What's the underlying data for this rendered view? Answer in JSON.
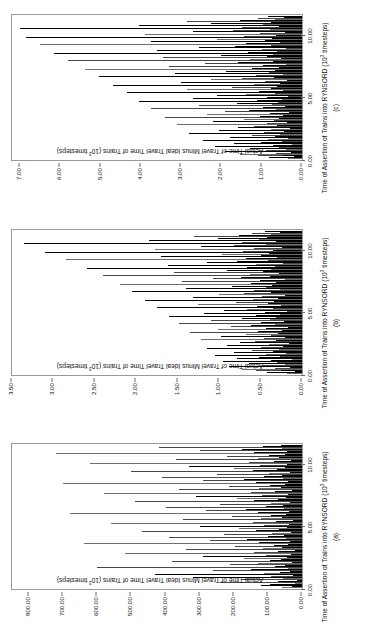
{
  "figure": {
    "orientation": "rotated-90-ccw",
    "background": "#ffffff",
    "frame_color": "#9a9a9a",
    "bar_color": "#000000"
  },
  "panels": [
    {
      "id": "a",
      "letter": "(a)",
      "x_title_main": "Time of Assertion of Trains into RYNSORD (10",
      "x_title_exp": "3",
      "x_title_tail": " timesteps)",
      "y_title_main": "Actual Time of Travel Minus Ideal Travel Time of Trains (10",
      "y_title_exp": "3",
      "y_title_tail": " timesteps)",
      "x_ticks": [
        "0.00",
        "5.00",
        "10.00"
      ],
      "x_tick_values": [
        0,
        5,
        10
      ],
      "y_ticks": [
        "0.00",
        "100.00",
        "200.00",
        "300.00",
        "400.00",
        "500.00",
        "600.00",
        "700.00",
        "800.00"
      ],
      "y_tick_values": [
        0,
        100,
        200,
        300,
        400,
        500,
        600,
        700,
        800
      ]
    },
    {
      "id": "b",
      "letter": "(b)",
      "x_title_main": "Time of Assertion of Trains into RYNSORD (10",
      "x_title_exp": "3",
      "x_title_tail": " timesteps)",
      "y_title_main": "Actual Time of Travel Minus Ideal Travel Time of Trains (10",
      "y_title_exp": "3",
      "y_title_tail": " timesteps)",
      "x_ticks": [
        "0.00",
        "5.00",
        "10.00"
      ],
      "x_tick_values": [
        0,
        5,
        10
      ],
      "y_ticks": [
        "0.00",
        "0.50",
        "1.00",
        "1.50",
        "2.00",
        "2.50",
        "3.00",
        "3.50"
      ],
      "y_tick_values": [
        0,
        0.5,
        1.0,
        1.5,
        2.0,
        2.5,
        3.0,
        3.5
      ]
    },
    {
      "id": "c",
      "letter": "(c)",
      "x_title_main": "Time of Assertion of Trains into RYNSORD (10",
      "x_title_exp": "3",
      "x_title_tail": " timesteps)",
      "y_title_main": "Actual Time of Travel Minus Ideal Travel Time of Trains (10",
      "y_title_exp": "3",
      "y_title_tail": " timesteps)",
      "x_ticks": [
        "0.00",
        "5.00",
        "10.00"
      ],
      "x_tick_values": [
        0,
        5,
        10
      ],
      "y_ticks": [
        "0.00",
        "1.00",
        "2.00",
        "3.00",
        "4.00",
        "5.00",
        "6.00",
        "7.00"
      ],
      "y_tick_values": [
        0,
        1,
        2,
        3,
        4,
        5,
        6,
        7
      ]
    }
  ],
  "chart_data": [
    {
      "type": "bar",
      "panel": "a",
      "title": "",
      "xlabel": "Time of Assertion of Trains into RYNSORD (10^3 timesteps)",
      "ylabel": "Actual Time of Travel Minus Ideal Travel Time of Trains (10^3 timesteps)",
      "xlim": [
        0,
        11.6
      ],
      "ylim": [
        0,
        850
      ],
      "grid": false,
      "legend": "none",
      "x": [
        0.05,
        0.12,
        0.2,
        0.28,
        0.35,
        0.42,
        0.5,
        0.58,
        0.66,
        0.74,
        0.82,
        0.9,
        0.98,
        1.06,
        1.14,
        1.22,
        1.3,
        1.38,
        1.46,
        1.54,
        1.62,
        1.7,
        1.78,
        1.86,
        1.94,
        2.02,
        2.1,
        2.18,
        2.26,
        2.34,
        2.42,
        2.5,
        2.58,
        2.66,
        2.74,
        2.82,
        2.9,
        2.98,
        3.06,
        3.14,
        3.22,
        3.3,
        3.38,
        3.46,
        3.54,
        3.62,
        3.7,
        3.78,
        3.86,
        3.94,
        4.02,
        4.1,
        4.18,
        4.26,
        4.34,
        4.42,
        4.5,
        4.58,
        4.66,
        4.74,
        4.82,
        4.9,
        4.98,
        5.06,
        5.14,
        5.22,
        5.3,
        5.38,
        5.46,
        5.54,
        5.62,
        5.7,
        5.78,
        5.86,
        5.94,
        6.02,
        6.1,
        6.18,
        6.26,
        6.34,
        6.42,
        6.5,
        6.58,
        6.66,
        6.74,
        6.82,
        6.9,
        6.98,
        7.06,
        7.14,
        7.22,
        7.3,
        7.38,
        7.46,
        7.54,
        7.62,
        7.7,
        7.78,
        7.86,
        7.94,
        8.02,
        8.1,
        8.18,
        8.26,
        8.34,
        8.42,
        8.5,
        8.58,
        8.66,
        8.74,
        8.82,
        8.9,
        8.98,
        9.06,
        9.14,
        9.22,
        9.3,
        9.38,
        9.46,
        9.54,
        9.62,
        9.7,
        9.78,
        9.86,
        9.94,
        10.02,
        10.1,
        10.18,
        10.26,
        10.34,
        10.42,
        10.5,
        10.58,
        10.66,
        10.74,
        10.82,
        10.9,
        10.98,
        11.06,
        11.14,
        11.22,
        11.3,
        11.38,
        11.46
      ],
      "values": [
        60,
        30,
        120,
        45,
        95,
        20,
        240,
        70,
        15,
        180,
        55,
        320,
        90,
        25,
        430,
        110,
        65,
        35,
        260,
        150,
        40,
        600,
        80,
        50,
        210,
        130,
        28,
        380,
        95,
        62,
        170,
        44,
        290,
        105,
        33,
        520,
        140,
        70,
        22,
        340,
        115,
        58,
        195,
        82,
        41,
        640,
        125,
        36,
        270,
        160,
        48,
        390,
        100,
        54,
        230,
        88,
        31,
        470,
        135,
        67,
        185,
        43,
        300,
        112,
        39,
        560,
        145,
        75,
        26,
        350,
        120,
        60,
        205,
        90,
        47,
        680,
        130,
        38,
        280,
        165,
        52,
        400,
        105,
        57,
        240,
        92,
        34,
        490,
        140,
        71,
        190,
        46,
        310,
        118,
        42,
        580,
        150,
        78,
        29,
        360,
        125,
        63,
        215,
        94,
        49,
        700,
        135,
        40,
        290,
        170,
        55,
        410,
        110,
        59,
        250,
        96,
        36,
        500,
        145,
        74,
        200,
        50,
        330,
        122,
        44,
        620,
        155,
        82,
        32,
        370,
        128,
        66,
        220,
        98,
        51,
        720,
        140,
        43,
        300,
        175,
        58,
        420,
        115,
        62,
        260,
        100
      ]
    },
    {
      "type": "bar",
      "panel": "b",
      "title": "",
      "xlabel": "Time of Assertion of Trains into RYNSORD (10^3 timesteps)",
      "ylabel": "Actual Time of Travel Minus Ideal Travel Time of Trains (10^3 timesteps)",
      "xlim": [
        0,
        11.6
      ],
      "ylim": [
        0,
        3.5
      ],
      "grid": false,
      "legend": "none",
      "x": [
        0.05,
        0.12,
        0.2,
        0.28,
        0.35,
        0.42,
        0.5,
        0.58,
        0.66,
        0.74,
        0.82,
        0.9,
        0.98,
        1.06,
        1.14,
        1.22,
        1.3,
        1.38,
        1.46,
        1.54,
        1.62,
        1.7,
        1.78,
        1.86,
        1.94,
        2.02,
        2.1,
        2.18,
        2.26,
        2.34,
        2.42,
        2.5,
        2.58,
        2.66,
        2.74,
        2.82,
        2.9,
        2.98,
        3.06,
        3.14,
        3.22,
        3.3,
        3.38,
        3.46,
        3.54,
        3.62,
        3.7,
        3.78,
        3.86,
        3.94,
        4.02,
        4.1,
        4.18,
        4.26,
        4.34,
        4.42,
        4.5,
        4.58,
        4.66,
        4.74,
        4.82,
        4.9,
        4.98,
        5.06,
        5.14,
        5.22,
        5.3,
        5.38,
        5.46,
        5.54,
        5.62,
        5.7,
        5.78,
        5.86,
        5.94,
        6.02,
        6.1,
        6.18,
        6.26,
        6.34,
        6.42,
        6.5,
        6.58,
        6.66,
        6.74,
        6.82,
        6.9,
        6.98,
        7.06,
        7.14,
        7.22,
        7.3,
        7.38,
        7.46,
        7.54,
        7.62,
        7.7,
        7.78,
        7.86,
        7.94,
        8.02,
        8.1,
        8.18,
        8.26,
        8.34,
        8.42,
        8.5,
        8.58,
        8.66,
        8.74,
        8.82,
        8.9,
        8.98,
        9.06,
        9.14,
        9.22,
        9.3,
        9.38,
        9.46,
        9.54,
        9.62,
        9.7,
        9.78,
        9.86,
        9.94,
        10.02,
        10.1,
        10.18,
        10.26,
        10.34,
        10.42,
        10.5,
        10.58,
        10.66,
        10.74,
        10.82,
        10.9,
        10.98,
        11.06,
        11.14,
        11.22,
        11.3,
        11.38,
        11.46
      ],
      "values": [
        0.18,
        0.42,
        0.09,
        0.55,
        0.25,
        0.72,
        0.33,
        0.15,
        0.88,
        0.47,
        0.21,
        0.64,
        0.3,
        0.95,
        0.38,
        0.12,
        0.78,
        0.52,
        0.26,
        1.05,
        0.44,
        0.19,
        0.82,
        0.35,
        0.6,
        0.28,
        1.15,
        0.49,
        0.23,
        0.91,
        0.4,
        0.16,
        0.75,
        0.57,
        0.31,
        1.22,
        0.46,
        0.2,
        0.98,
        0.37,
        0.68,
        0.29,
        1.35,
        0.53,
        0.24,
        1.02,
        0.43,
        0.17,
        0.86,
        0.61,
        0.33,
        1.48,
        0.5,
        0.22,
        1.1,
        0.39,
        0.73,
        0.32,
        1.6,
        0.56,
        0.27,
        1.18,
        0.45,
        0.18,
        0.94,
        0.66,
        0.35,
        1.75,
        0.54,
        0.25,
        1.25,
        0.41,
        0.8,
        0.34,
        1.9,
        0.59,
        0.29,
        1.32,
        0.48,
        0.2,
        1.0,
        0.7,
        0.37,
        2.05,
        0.58,
        0.26,
        1.4,
        0.44,
        0.85,
        0.36,
        2.2,
        0.62,
        0.31,
        1.45,
        0.51,
        0.21,
        1.08,
        0.74,
        0.39,
        2.4,
        0.63,
        0.28,
        1.55,
        0.47,
        0.9,
        0.38,
        2.6,
        0.66,
        0.33,
        1.62,
        0.55,
        0.23,
        1.15,
        0.78,
        0.41,
        2.85,
        0.68,
        0.3,
        1.7,
        0.5,
        0.96,
        0.4,
        3.1,
        0.71,
        0.35,
        1.78,
        0.58,
        0.24,
        1.22,
        0.82,
        0.43,
        3.35,
        0.73,
        0.32,
        1.85,
        0.52,
        1.02,
        0.42,
        1.3,
        0.76,
        0.37,
        0.6,
        0.26,
        0.45
      ]
    },
    {
      "type": "bar",
      "panel": "c",
      "title": "",
      "xlabel": "Time of Assertion of Trains into RYNSORD (10^3 timesteps)",
      "ylabel": "Actual Time of Travel Minus Ideal Travel Time of Trains (10^3 timesteps)",
      "xlim": [
        0,
        11.6
      ],
      "ylim": [
        0,
        7.2
      ],
      "grid": false,
      "legend": "none",
      "x": [
        0.05,
        0.12,
        0.2,
        0.28,
        0.35,
        0.42,
        0.5,
        0.58,
        0.66,
        0.74,
        0.82,
        0.9,
        0.98,
        1.06,
        1.14,
        1.22,
        1.3,
        1.38,
        1.46,
        1.54,
        1.62,
        1.7,
        1.78,
        1.86,
        1.94,
        2.02,
        2.1,
        2.18,
        2.26,
        2.34,
        2.42,
        2.5,
        2.58,
        2.66,
        2.74,
        2.82,
        2.9,
        2.98,
        3.06,
        3.14,
        3.22,
        3.3,
        3.38,
        3.46,
        3.54,
        3.62,
        3.7,
        3.78,
        3.86,
        3.94,
        4.02,
        4.1,
        4.18,
        4.26,
        4.34,
        4.42,
        4.5,
        4.58,
        4.66,
        4.74,
        4.82,
        4.9,
        4.98,
        5.06,
        5.14,
        5.22,
        5.3,
        5.38,
        5.46,
        5.54,
        5.62,
        5.7,
        5.78,
        5.86,
        5.94,
        6.02,
        6.1,
        6.18,
        6.26,
        6.34,
        6.42,
        6.5,
        6.58,
        6.66,
        6.74,
        6.82,
        6.9,
        6.98,
        7.06,
        7.14,
        7.22,
        7.3,
        7.38,
        7.46,
        7.54,
        7.62,
        7.7,
        7.78,
        7.86,
        7.94,
        8.02,
        8.1,
        8.18,
        8.26,
        8.34,
        8.42,
        8.5,
        8.58,
        8.66,
        8.74,
        8.82,
        8.9,
        8.98,
        9.06,
        9.14,
        9.22,
        9.3,
        9.38,
        9.46,
        9.54,
        9.62,
        9.7,
        9.78,
        9.86,
        9.94,
        10.02,
        10.1,
        10.18,
        10.26,
        10.34,
        10.42,
        10.5,
        10.58,
        10.66,
        10.74,
        10.82,
        10.9,
        10.98,
        11.06,
        11.14,
        11.22,
        11.3,
        11.38,
        11.46
      ],
      "values": [
        0.35,
        0.82,
        0.2,
        1.1,
        0.48,
        1.55,
        0.65,
        0.28,
        1.92,
        0.9,
        0.4,
        1.3,
        0.58,
        2.15,
        0.72,
        0.25,
        1.7,
        1.02,
        0.5,
        2.45,
        0.85,
        0.34,
        1.8,
        0.68,
        1.25,
        0.55,
        2.8,
        0.95,
        0.44,
        2.05,
        0.78,
        0.3,
        1.6,
        1.18,
        0.62,
        3.1,
        0.88,
        0.38,
        2.2,
        0.7,
        1.45,
        0.56,
        3.4,
        1.05,
        0.46,
        2.35,
        0.8,
        0.32,
        1.9,
        1.32,
        0.64,
        3.75,
        0.98,
        0.42,
        2.55,
        0.74,
        1.62,
        0.6,
        4.05,
        1.12,
        0.5,
        2.7,
        0.86,
        0.35,
        2.1,
        1.4,
        0.66,
        4.35,
        1.08,
        0.47,
        2.85,
        0.78,
        1.75,
        0.63,
        4.7,
        1.2,
        0.54,
        3.0,
        0.92,
        0.37,
        2.25,
        1.5,
        0.7,
        5.05,
        1.15,
        0.48,
        3.15,
        0.82,
        1.88,
        0.68,
        5.4,
        1.25,
        0.58,
        3.3,
        0.96,
        0.39,
        2.4,
        1.58,
        0.73,
        5.8,
        1.3,
        0.52,
        3.45,
        0.88,
        2.0,
        0.71,
        6.15,
        1.35,
        0.61,
        3.6,
        1.0,
        0.41,
        2.55,
        1.66,
        0.76,
        6.5,
        1.4,
        0.55,
        3.75,
        0.92,
        2.12,
        0.74,
        6.85,
        1.45,
        0.64,
        3.9,
        1.05,
        0.43,
        2.7,
        1.72,
        0.8,
        7.0,
        1.5,
        0.58,
        4.05,
        0.96,
        2.25,
        0.78,
        2.85,
        1.55,
        0.67,
        1.1,
        0.45,
        0.85
      ]
    }
  ]
}
